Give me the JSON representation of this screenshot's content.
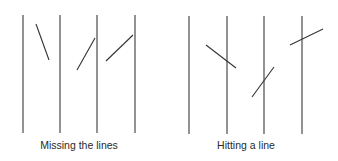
{
  "colors": {
    "background": "#ffffff",
    "line": "#3a3a3a",
    "needle": "#333333",
    "text": "#2a2a2a"
  },
  "panels": [
    {
      "id": "missing",
      "label": "Missing the lines",
      "label_x": 79,
      "parallel_lines": [
        {
          "x": 23,
          "y1": 15,
          "y2": 133
        },
        {
          "x": 60,
          "y1": 15,
          "y2": 133
        },
        {
          "x": 97,
          "y1": 15,
          "y2": 133
        },
        {
          "x": 135,
          "y1": 15,
          "y2": 133
        }
      ],
      "needles": [
        {
          "x1": 36,
          "y1": 24,
          "x2": 49,
          "y2": 60
        },
        {
          "x1": 77,
          "y1": 70,
          "x2": 95,
          "y2": 38
        },
        {
          "x1": 106,
          "y1": 61,
          "x2": 133,
          "y2": 35
        }
      ]
    },
    {
      "id": "hitting",
      "label": "Hitting a line",
      "label_x": 246,
      "parallel_lines": [
        {
          "x": 189,
          "y1": 16,
          "y2": 134
        },
        {
          "x": 227,
          "y1": 16,
          "y2": 134
        },
        {
          "x": 264,
          "y1": 16,
          "y2": 134
        },
        {
          "x": 302,
          "y1": 16,
          "y2": 134
        }
      ],
      "needles": [
        {
          "x1": 206,
          "y1": 45,
          "x2": 236,
          "y2": 68
        },
        {
          "x1": 252,
          "y1": 97,
          "x2": 274,
          "y2": 67
        },
        {
          "x1": 290,
          "y1": 45,
          "x2": 323,
          "y2": 29
        }
      ]
    }
  ]
}
